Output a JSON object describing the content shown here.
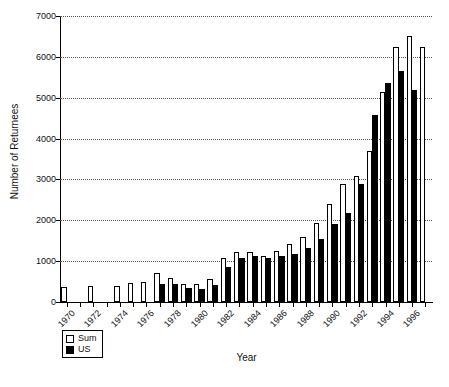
{
  "chart_data": {
    "type": "bar",
    "title": "",
    "xlabel": "Year",
    "ylabel": "Number of Returnees",
    "ylim": [
      0,
      7000
    ],
    "yticks": [
      0,
      1000,
      2000,
      3000,
      4000,
      5000,
      6000,
      7000
    ],
    "grid": true,
    "legend_position": "below-left",
    "xtick_labels": [
      "1970",
      "1972",
      "1974",
      "1976",
      "1978",
      "1980",
      "1982",
      "1984",
      "1986",
      "1988",
      "1990",
      "1992",
      "1994",
      "1996"
    ],
    "categories": [
      "1970",
      "1971",
      "1972",
      "1973",
      "1974",
      "1975",
      "1976",
      "1977",
      "1978",
      "1979",
      "1980",
      "1981",
      "1982",
      "1983",
      "1984",
      "1985",
      "1986",
      "1987",
      "1988",
      "1989",
      "1990",
      "1991",
      "1992",
      "1993",
      "1994",
      "1995",
      "1996",
      "1997"
    ],
    "series": [
      {
        "name": "Sum",
        "color": "#ffffff",
        "values": [
          360,
          0,
          390,
          0,
          400,
          470,
          500,
          720,
          600,
          430,
          450,
          560,
          1080,
          1220,
          1230,
          1120,
          1250,
          1430,
          1590,
          1930,
          2400,
          2900,
          3080,
          3700,
          5150,
          6250,
          6500,
          6250
        ]
      },
      {
        "name": "US",
        "color": "#000000",
        "values": [
          0,
          0,
          0,
          0,
          0,
          0,
          0,
          430,
          440,
          350,
          330,
          420,
          850,
          1080,
          1120,
          1070,
          1120,
          1170,
          1320,
          1540,
          1900,
          2170,
          2880,
          4580,
          5370,
          5650,
          5200,
          0
        ]
      }
    ]
  },
  "legend": {
    "items": [
      {
        "label": "Sum",
        "swatch": "open-square-swatch"
      },
      {
        "label": "US",
        "swatch": "filled-square-swatch"
      }
    ]
  }
}
